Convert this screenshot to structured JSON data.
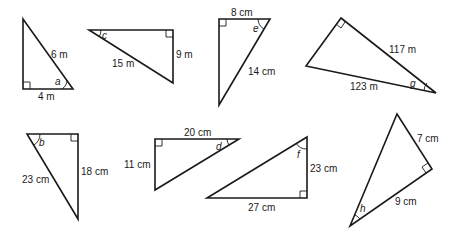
{
  "diagram": {
    "triangles": [
      {
        "id": "a",
        "angle_label": "a",
        "sides": [
          {
            "label": "6 m",
            "role": "hypotenuse"
          },
          {
            "label": "4 m",
            "role": "adjacent"
          }
        ]
      },
      {
        "id": "c",
        "angle_label": "c",
        "sides": [
          {
            "label": "15 m",
            "role": "hypotenuse"
          },
          {
            "label": "9 m",
            "role": "opposite"
          }
        ]
      },
      {
        "id": "e",
        "angle_label": "e",
        "sides": [
          {
            "label": "8 cm",
            "role": "adjacent"
          },
          {
            "label": "14 cm",
            "role": "hypotenuse"
          }
        ]
      },
      {
        "id": "g",
        "angle_label": "g",
        "sides": [
          {
            "label": "117 m",
            "role": "adjacent"
          },
          {
            "label": "123 m",
            "role": "hypotenuse"
          }
        ]
      },
      {
        "id": "b",
        "angle_label": "b",
        "sides": [
          {
            "label": "23 cm",
            "role": "hypotenuse"
          },
          {
            "label": "18 cm",
            "role": "opposite"
          }
        ]
      },
      {
        "id": "d",
        "angle_label": "d",
        "sides": [
          {
            "label": "20 cm",
            "role": "adjacent"
          },
          {
            "label": "11 cm",
            "role": "opposite"
          }
        ]
      },
      {
        "id": "f",
        "angle_label": "f",
        "sides": [
          {
            "label": "23 cm",
            "role": "adjacent"
          },
          {
            "label": "27 cm",
            "role": "opposite"
          }
        ]
      },
      {
        "id": "h",
        "angle_label": "h",
        "sides": [
          {
            "label": "7 cm",
            "role": "opposite"
          },
          {
            "label": "9 cm",
            "role": "adjacent"
          }
        ]
      }
    ]
  }
}
